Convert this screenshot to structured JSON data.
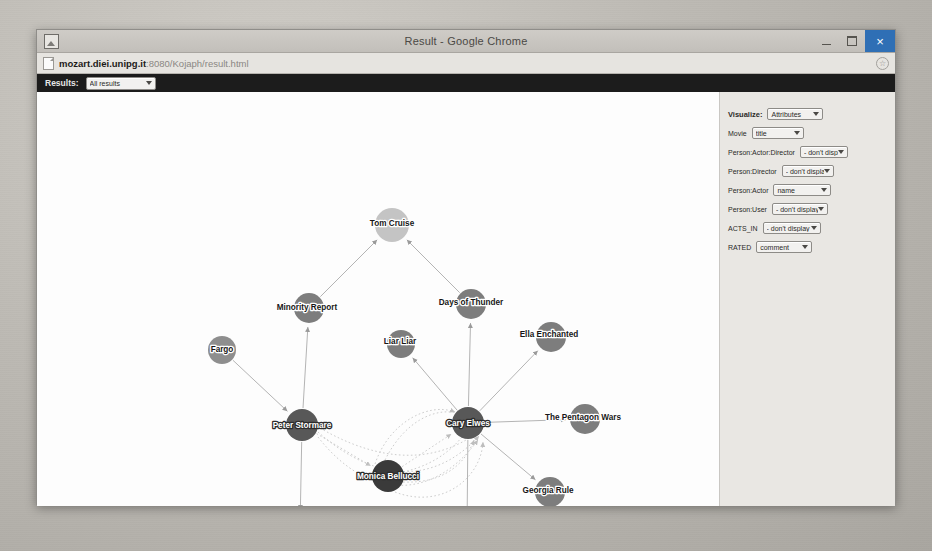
{
  "window": {
    "title": "Result - Google Chrome",
    "icon": "page-image-icon",
    "controls": {
      "minimize": "—",
      "maximize": "□",
      "close": "×"
    }
  },
  "browser": {
    "url_host": "mozart.diei.unipg.it",
    "url_rest": ":8080/Kojaph/result.html",
    "url_full": "mozart.diei.unipg.it:8080/Kojaph/result.html",
    "bookmark_icon": "star-icon",
    "page_icon": "document-icon"
  },
  "toolbar": {
    "results_label": "Results:",
    "results_value": "All results"
  },
  "panel": {
    "rows": [
      {
        "name": "visualize",
        "label": "Visualize:",
        "value": "Attributes",
        "width": 48
      },
      {
        "name": "movie",
        "label": "Movie",
        "value": "title",
        "width": 44
      },
      {
        "name": "person-actor-director",
        "label": "Person:Actor:Director",
        "value": "- don't display -",
        "width": 40
      },
      {
        "name": "person-director",
        "label": "Person:Director",
        "value": "- don't display -",
        "width": 44
      },
      {
        "name": "person-actor",
        "label": "Person:Actor",
        "value": "name",
        "width": 50
      },
      {
        "name": "person-user",
        "label": "Person:User",
        "value": "- don't display -",
        "width": 48
      },
      {
        "name": "acts-in",
        "label": "ACTS_IN",
        "value": "- don't display -",
        "width": 50
      },
      {
        "name": "rated",
        "label": "RATED",
        "value": "comment",
        "width": 48
      }
    ]
  },
  "colors": {
    "node_movie": "#7d7d7d",
    "node_actor_light": "#c4c4c4",
    "node_actor_dark": "#3a3a3a",
    "node_mid": "#8e8e8e",
    "edge": "#b4b4b4",
    "edge_dotted": "#cdcdcd",
    "canvas_bg": "#fdfdfd",
    "panel_bg": "#e9e7e3",
    "toolbar_bg": "#1c1c1c",
    "close_button": "#2f6fb5"
  },
  "graph": {
    "nodes": [
      {
        "id": "tom-cruise",
        "label": "Tom Cruise",
        "x": 355,
        "y": 133,
        "r": 17,
        "fill": "#c4c4c4",
        "text": "light",
        "anchor": "middle",
        "dx": 0,
        "dy": -2
      },
      {
        "id": "minority-report",
        "label": "Minority Report",
        "x": 272,
        "y": 216,
        "r": 15,
        "fill": "#7d7d7d",
        "text": "light",
        "anchor": "middle",
        "dx": -2,
        "dy": -1
      },
      {
        "id": "days-of-thunder",
        "label": "Days of Thunder",
        "x": 434,
        "y": 212,
        "r": 15,
        "fill": "#7d7d7d",
        "text": "light",
        "anchor": "middle",
        "dx": 0,
        "dy": -2
      },
      {
        "id": "fargo",
        "label": "Fargo",
        "x": 185,
        "y": 258,
        "r": 14,
        "fill": "#8e8e8e",
        "text": "light",
        "anchor": "middle",
        "dx": 0,
        "dy": -1
      },
      {
        "id": "liar-liar",
        "label": "Liar Liar",
        "x": 364,
        "y": 252,
        "r": 14,
        "fill": "#7d7d7d",
        "text": "light",
        "anchor": "middle",
        "dx": -1,
        "dy": -3
      },
      {
        "id": "ella-enchanted",
        "label": "Ella Enchanted",
        "x": 514,
        "y": 245,
        "r": 15,
        "fill": "#7d7d7d",
        "text": "light",
        "anchor": "middle",
        "dx": -2,
        "dy": -3
      },
      {
        "id": "peter-stormare",
        "label": "Peter Stormare",
        "x": 265,
        "y": 333,
        "r": 16,
        "fill": "#585858",
        "text": "dark",
        "anchor": "middle",
        "dx": 0,
        "dy": 0
      },
      {
        "id": "cary-elwes",
        "label": "Cary Elwes",
        "x": 431,
        "y": 331,
        "r": 16,
        "fill": "#585858",
        "text": "dark",
        "anchor": "middle",
        "dx": 0,
        "dy": 0
      },
      {
        "id": "pentagon-wars",
        "label": "The Pentagon Wars",
        "x": 548,
        "y": 327,
        "r": 15,
        "fill": "#7d7d7d",
        "text": "light",
        "anchor": "middle",
        "dx": -2,
        "dy": -2
      },
      {
        "id": "monica-bellucci",
        "label": "Monica Bellucci",
        "x": 351,
        "y": 384,
        "r": 16,
        "fill": "#3a3a3a",
        "text": "dark",
        "anchor": "middle",
        "dx": 0,
        "dy": 0
      },
      {
        "id": "georgia-rule",
        "label": "Georgia Rule",
        "x": 513,
        "y": 400,
        "r": 15,
        "fill": "#7d7d7d",
        "text": "light",
        "anchor": "middle",
        "dx": -2,
        "dy": -2
      },
      {
        "id": "chocolat",
        "label": "Chocolat",
        "x": 263,
        "y": 437,
        "r": 15,
        "fill": "#8e8e8e",
        "text": "light",
        "anchor": "middle",
        "dx": -2,
        "dy": -2
      },
      {
        "id": "robin-hood",
        "label": "Robin Hood: Men in Tights",
        "x": 430,
        "y": 440,
        "r": 15,
        "fill": "#8e8e8e",
        "text": "light",
        "anchor": "middle",
        "dx": -8,
        "dy": -2
      }
    ],
    "edges": [
      {
        "from": "minority-report",
        "to": "tom-cruise",
        "style": "solid"
      },
      {
        "from": "days-of-thunder",
        "to": "tom-cruise",
        "style": "solid"
      },
      {
        "from": "peter-stormare",
        "to": "minority-report",
        "style": "solid"
      },
      {
        "from": "fargo",
        "to": "peter-stormare",
        "style": "solid"
      },
      {
        "from": "peter-stormare",
        "to": "chocolat",
        "style": "solid"
      },
      {
        "from": "cary-elwes",
        "to": "days-of-thunder",
        "style": "solid"
      },
      {
        "from": "cary-elwes",
        "to": "liar-liar",
        "style": "solid"
      },
      {
        "from": "cary-elwes",
        "to": "ella-enchanted",
        "style": "solid"
      },
      {
        "from": "cary-elwes",
        "to": "pentagon-wars",
        "style": "solid"
      },
      {
        "from": "cary-elwes",
        "to": "robin-hood",
        "style": "solid"
      },
      {
        "from": "cary-elwes",
        "to": "georgia-rule",
        "style": "solid"
      },
      {
        "from": "monica-bellucci",
        "to": "cary-elwes",
        "style": "dotted"
      },
      {
        "from": "peter-stormare",
        "to": "monica-bellucci",
        "style": "dotted"
      }
    ],
    "curves": [
      {
        "name": "rated-curve-1",
        "d": "M 281 345 C 330 408 395 410 441 348",
        "style": "dotted"
      },
      {
        "name": "rated-curve-2",
        "d": "M 281 340 C 340 392 398 392 442 344",
        "style": "dotted"
      },
      {
        "name": "rated-curve-3",
        "d": "M 283 336 C 345 372 400 372 444 338",
        "style": "dotted"
      },
      {
        "name": "rated-curve-4",
        "d": "M 366 380 C 402 372 420 352 428 341",
        "style": "dotted"
      },
      {
        "name": "rated-curve-5",
        "d": "M 366 390 C 410 392 430 368 437 348",
        "style": "dotted"
      },
      {
        "name": "rated-curve-6",
        "d": "M 358 400 C 405 418 444 386 446 350",
        "style": "dotted"
      },
      {
        "name": "rated-curve-7",
        "d": "M 338 372 C 352 330 392 310 418 320",
        "style": "dotted"
      },
      {
        "name": "rated-curve-8",
        "d": "M 348 368 C 368 328 400 314 424 322",
        "style": "dotted"
      }
    ]
  }
}
